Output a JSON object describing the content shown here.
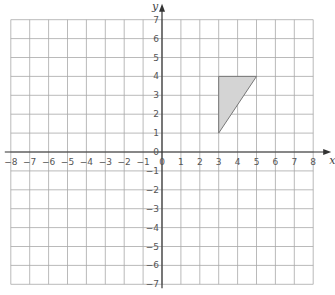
{
  "diagram": {
    "type": "coordinate-grid",
    "x_axis": {
      "label": "x",
      "min": -8,
      "max": 8,
      "ticks": [
        "-8",
        "-7",
        "-6",
        "-5",
        "-4",
        "-3",
        "-2",
        "-1",
        "0",
        "1",
        "2",
        "3",
        "4",
        "5",
        "6",
        "7",
        "8"
      ]
    },
    "y_axis": {
      "label": "y",
      "min": -7,
      "max": 7,
      "ticks": [
        "-7",
        "-6",
        "-5",
        "-4",
        "-3",
        "-2",
        "-1",
        "0",
        "1",
        "2",
        "3",
        "4",
        "5",
        "6",
        "7"
      ]
    },
    "grid": true,
    "shapes": [
      {
        "name": "triangle",
        "vertices": [
          [
            3,
            1
          ],
          [
            3,
            4
          ],
          [
            5,
            4
          ]
        ],
        "fill": "#d4d4d4",
        "stroke": "#777777"
      }
    ]
  }
}
